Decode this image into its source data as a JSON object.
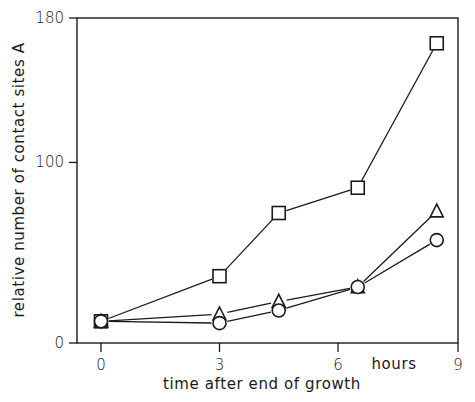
{
  "chart_data": {
    "type": "line",
    "title": "",
    "xlabel": "time after end of growth",
    "x_unit_label": "hours",
    "ylabel": "relative number of contact sites A",
    "xlim": [
      0,
      9
    ],
    "ylim": [
      0,
      180
    ],
    "x_ticks": [
      0,
      3,
      6,
      9
    ],
    "x_tick_labels": [
      "0",
      "3",
      "6",
      "9"
    ],
    "y_ticks": [
      0,
      100,
      180
    ],
    "y_tick_labels": [
      "0",
      "100",
      "180"
    ],
    "grid": false,
    "legend": null,
    "series": [
      {
        "name": "squares",
        "marker": "square",
        "x": [
          0,
          3,
          4.5,
          6.5,
          8.5
        ],
        "values": [
          12,
          37,
          72,
          86,
          166
        ]
      },
      {
        "name": "triangles",
        "marker": "triangle",
        "x": [
          0,
          3,
          4.5,
          6.5,
          8.5
        ],
        "values": [
          12,
          16,
          23,
          31,
          73
        ]
      },
      {
        "name": "circles",
        "marker": "circle",
        "x": [
          0,
          3,
          4.5,
          6.5,
          8.5
        ],
        "values": [
          12,
          11,
          18,
          31,
          57
        ]
      }
    ]
  }
}
